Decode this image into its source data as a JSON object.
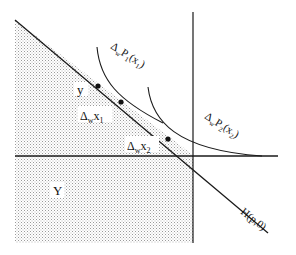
{
  "diagram": {
    "type": "production-set-illustration",
    "labels": {
      "y": "y",
      "dx1": "Δ",
      "dx1_sub": "w",
      "dx1_tail": "x",
      "dx1_idx": "1",
      "dx2": "Δ",
      "dx2_sub": "w",
      "dx2_tail": "x",
      "dx2_idx": "2",
      "P1_delta": "Δ",
      "P1_sub": "w",
      "P1_body": "P",
      "P1_i": "1",
      "P1_paren": "(x",
      "P1_pi": "1",
      "P1_close": ")",
      "P2_delta": "Δ",
      "P2_sub": "w",
      "P2_body": "P",
      "P2_i": "2",
      "P2_paren": "(x",
      "P2_pi": "2",
      "P2_close": ")",
      "region": "Y",
      "hyperplane": "H(p,0)"
    },
    "points": [
      {
        "name": "y",
        "x": 98,
        "y": 86
      },
      {
        "name": "dwx1",
        "x": 121,
        "y": 102
      },
      {
        "name": "dwx2",
        "x": 168,
        "y": 139
      }
    ],
    "colors": {
      "line": "#1a1a1a",
      "shade": "#bdbdbd",
      "background": "#ffffff"
    }
  }
}
